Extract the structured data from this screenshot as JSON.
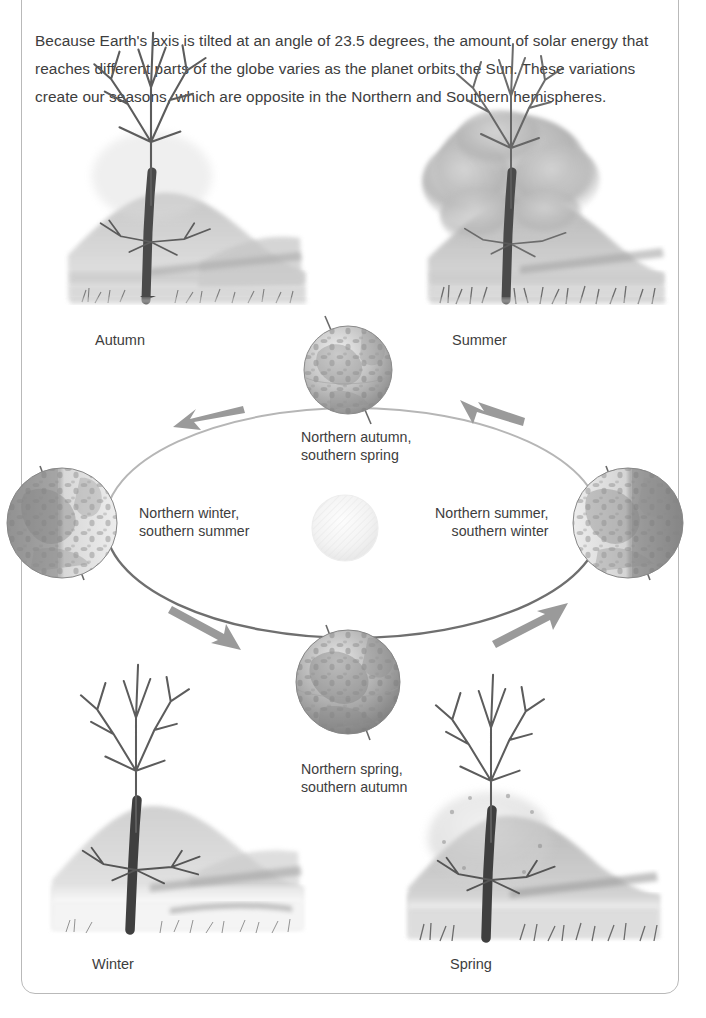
{
  "page": {
    "intro_paragraph": "Because Earth's axis is tilted at an angle of 23.5 degrees, the amount of solar energy that reaches different parts of the globe varies as the planet orbits the Sun. These variations create our seasons, which are opposite in the Northern and Southern hemispheres."
  },
  "season_scenes": [
    {
      "id": "autumn",
      "label": "Autumn",
      "tree_state": "bare-sparse-leaves",
      "position": "top-left"
    },
    {
      "id": "summer",
      "label": "Summer",
      "tree_state": "full-foliage",
      "position": "top-right"
    },
    {
      "id": "winter",
      "label": "Winter",
      "tree_state": "bare-snow-ground",
      "position": "bottom-left"
    },
    {
      "id": "spring",
      "label": "Spring",
      "tree_state": "budding-new-leaves",
      "position": "bottom-right"
    }
  ],
  "orbit": {
    "sun_label": "Sun",
    "direction": "counter-clockwise",
    "positions": [
      {
        "id": "top",
        "line1": "Northern autumn,",
        "line2": "southern spring"
      },
      {
        "id": "left",
        "line1": "Northern winter,",
        "line2": "southern summer"
      },
      {
        "id": "right",
        "line1": "Northern summer,",
        "line2": "southern winter"
      },
      {
        "id": "bottom",
        "line1": "Northern spring,",
        "line2": "southern autumn"
      }
    ],
    "axis_tilt_degrees": "23.5"
  },
  "colors": {
    "frame": "#b9b9b9",
    "text": "#3d3d3d",
    "orbit_far": "#b0b0b0",
    "orbit_near": "#6e6e6e",
    "arrow": "#9a9a9a",
    "globe_dark": "#7d7d7d",
    "globe_light": "#e8e8e8",
    "sun": "#f4f4f4",
    "landscape": "#9d9d9d"
  }
}
